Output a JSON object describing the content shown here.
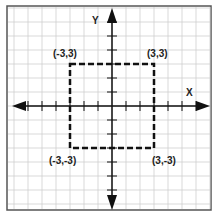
{
  "diagram": {
    "type": "coordinate-plane",
    "x_axis_label": "X",
    "y_axis_label": "Y",
    "unit_px": 14,
    "grid_range": [
      -7,
      7
    ],
    "shape": {
      "kind": "square",
      "style": "dashed",
      "vertices": [
        {
          "label": "(-3,3)",
          "x": -3,
          "y": 3
        },
        {
          "label": "(3,3)",
          "x": 3,
          "y": 3
        },
        {
          "label": "(3,-3)",
          "x": 3,
          "y": -3
        },
        {
          "label": "(-3,-3)",
          "x": -3,
          "y": -3
        }
      ]
    },
    "colors": {
      "grid": "#cfcfcf",
      "axis": "#111111",
      "border": "#555555",
      "shape": "#111111"
    }
  }
}
